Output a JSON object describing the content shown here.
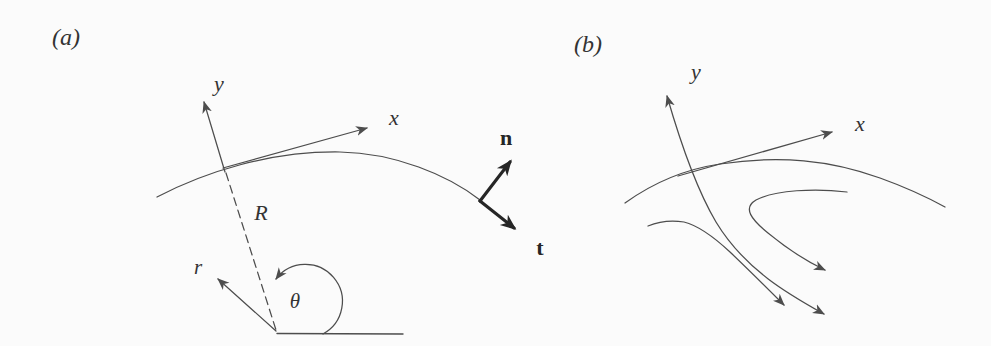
{
  "figure": {
    "panel_a": {
      "tag": "(a)",
      "axis_labels": {
        "y": "y",
        "x": "x"
      },
      "radius_label": "R",
      "polar_labels": {
        "r": "r",
        "theta": "θ"
      },
      "vector_labels": {
        "normal": "n",
        "tangent": "t"
      }
    },
    "panel_b": {
      "tag": "(b)",
      "axis_labels": {
        "y": "y",
        "x": "x"
      }
    }
  },
  "colors": {
    "background": "#fbfbfb",
    "line": "#4d4d4d",
    "bold_vector": "#262626",
    "text": "#333333"
  }
}
